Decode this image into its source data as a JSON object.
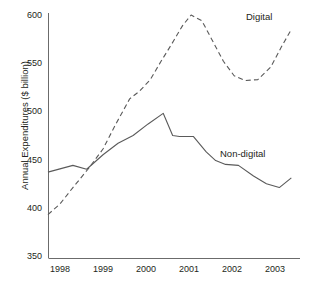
{
  "chart_data": {
    "type": "line",
    "title": "",
    "xlabel": "",
    "ylabel": "Annual Expenditures ($ billion)",
    "xlim": [
      1997.7,
      2003.4
    ],
    "ylim": [
      350,
      600
    ],
    "grid": false,
    "legend_position": "inline-right",
    "x_ticks": [
      "1998",
      "1999",
      "2000",
      "2001",
      "2002",
      "2003"
    ],
    "x_tick_values": [
      1998,
      1999,
      2000,
      2001,
      2002,
      2003
    ],
    "y_ticks": [
      "350",
      "400",
      "450",
      "500",
      "550",
      "600"
    ],
    "y_tick_values": [
      350,
      400,
      450,
      500,
      550,
      600
    ],
    "series": [
      {
        "name": "Digital",
        "style": "dashed",
        "color": "#5a5a5a",
        "x": [
          1997.72,
          1998.0,
          1998.3,
          1998.65,
          1999.0,
          1999.3,
          1999.62,
          1999.85,
          2000.1,
          2000.35,
          2000.6,
          2000.85,
          2001.05,
          2001.3,
          2001.55,
          2001.8,
          2002.05,
          2002.3,
          2002.6,
          2002.9,
          2003.15,
          2003.38
        ],
        "values": [
          393,
          404,
          421,
          440,
          461,
          487,
          513,
          521,
          533,
          552,
          570,
          589,
          600,
          594,
          573,
          552,
          537,
          532,
          533,
          546,
          567,
          585
        ]
      },
      {
        "name": "Non-digital",
        "style": "solid",
        "color": "#5a5a5a",
        "x": [
          1997.72,
          1998.3,
          1998.62,
          1999.0,
          1999.35,
          1999.7,
          2000.05,
          2000.4,
          2000.62,
          2000.78,
          2001.1,
          2001.4,
          2001.62,
          2001.85,
          2002.15,
          2002.5,
          2002.8,
          2003.1,
          2003.38
        ],
        "values": [
          437,
          444,
          440,
          455,
          467,
          475,
          487,
          498,
          475,
          474,
          474,
          458,
          449,
          445,
          444,
          433,
          425,
          421,
          431
        ]
      }
    ]
  },
  "axes": {
    "y_axis_title": "Annual Expenditures ($ billion)"
  },
  "labels": {
    "digital": "Digital",
    "non_digital": "Non-digital"
  },
  "caption": {
    "partial_text": ""
  }
}
